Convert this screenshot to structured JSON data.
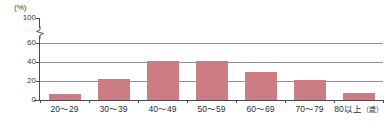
{
  "chart_data": {
    "type": "bar",
    "title": "",
    "subtitle": "",
    "xlabel": "",
    "ylabel": "(%)",
    "unit_label": "(%)",
    "x_unit_suffix": "(歳)",
    "categories": [
      "20〜29",
      "30〜39",
      "40〜49",
      "50〜59",
      "60〜69",
      "70〜79",
      "80以上"
    ],
    "values": [
      6,
      22,
      41,
      41,
      30,
      21,
      7
    ],
    "ylim": [
      0,
      100
    ],
    "y_ticks": [
      0,
      20,
      40,
      60,
      100
    ],
    "y_tick_labels": [
      "0",
      "20",
      "40",
      "60",
      "100"
    ],
    "axis_break": {
      "present": true,
      "between": [
        60,
        100
      ],
      "symbol": "axis-break-squiggle"
    },
    "grid": {
      "horizontal": true,
      "vertical": false,
      "gridline_values": [
        20,
        40,
        60
      ]
    },
    "legend": {
      "present": false,
      "position": "none",
      "entries": []
    },
    "colors": {
      "bar": "#cc7c84",
      "gridline": "#8f8f8f",
      "axis": "#4a4a4a",
      "text": "#2e2e2e",
      "background": "#ffffff"
    }
  },
  "axis": {
    "y_unit": "(%)",
    "y_tick_100": "100",
    "y_tick_60": "60",
    "y_tick_40": "40",
    "y_tick_20": "20",
    "y_tick_0": "0"
  },
  "x_labels": [
    {
      "text": "20〜29",
      "suffix": ""
    },
    {
      "text": "30〜39",
      "suffix": ""
    },
    {
      "text": "40〜49",
      "suffix": ""
    },
    {
      "text": "50〜59",
      "suffix": ""
    },
    {
      "text": "60〜69",
      "suffix": ""
    },
    {
      "text": "70〜79",
      "suffix": ""
    },
    {
      "text": "80以上",
      "suffix": "（歳）"
    }
  ]
}
